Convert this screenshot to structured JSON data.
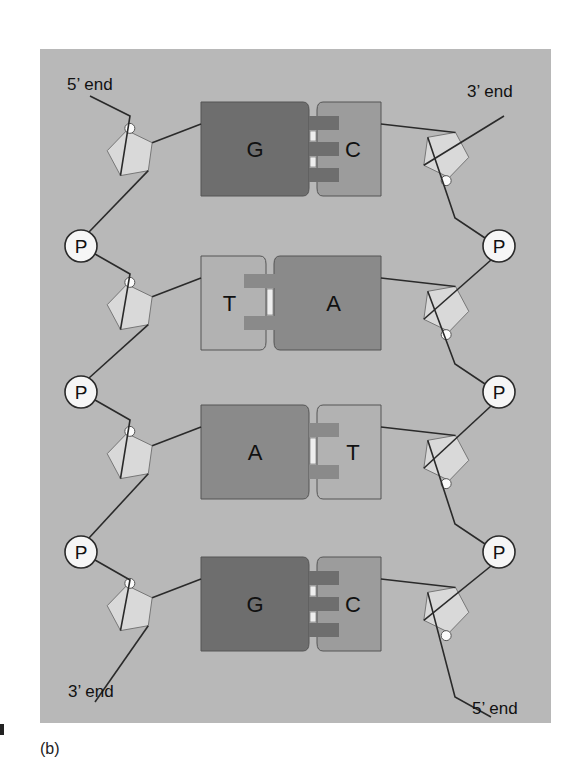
{
  "figure": {
    "panel_label": "(b)",
    "colors": {
      "panel_bg": "#b8b8b8",
      "sugar": "#d9d9d9",
      "phosphate": "#f6f6f6",
      "guanine": "#6e6e6e",
      "cytosine": "#9c9c9c",
      "adenine": "#8a8a8a",
      "thymine": "#b2b2b2",
      "line": "#2a2a2a"
    },
    "end_labels": {
      "top_left": "5’ end",
      "top_right": "3’ end",
      "bottom_left": "3’ end",
      "bottom_right": "5’ end"
    },
    "phosphate_label": "P",
    "base_pairs": [
      {
        "left": "G",
        "right": "C",
        "hbonds": 3
      },
      {
        "left": "T",
        "right": "A",
        "hbonds": 2
      },
      {
        "left": "A",
        "right": "T",
        "hbonds": 2
      },
      {
        "left": "G",
        "right": "C",
        "hbonds": 3
      }
    ]
  }
}
